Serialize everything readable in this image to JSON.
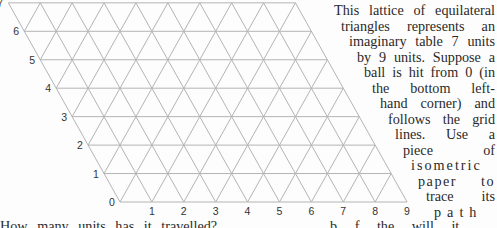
{
  "figure": {
    "type": "isometric-lattice",
    "rows": 7,
    "columns": 9,
    "row_labels": [
      "0",
      "1",
      "2",
      "3",
      "4",
      "5",
      "6",
      "7"
    ],
    "column_labels": [
      "1",
      "2",
      "3",
      "4",
      "5",
      "6",
      "7",
      "8",
      "9"
    ],
    "line_color": "#b4b4b4",
    "label_color": "#333333"
  },
  "paragraph": {
    "lines": [
      "This lattice of equilateral",
      "triangles represents an",
      "imaginary table 7 units",
      "by 9 units. Suppose a",
      "ball is hit from 0 (in",
      "the bottom left-",
      "hand corner) and",
      "follows the grid",
      "lines. Use a",
      "piece of",
      "isometric",
      "paper to",
      "trace its",
      "path"
    ]
  },
  "bottom_line": {
    "left": "How many units has it travelled?",
    "right": "b f the will it"
  }
}
